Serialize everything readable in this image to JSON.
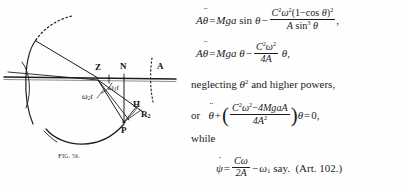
{
  "figure": {
    "caption_prefix": "F",
    "caption": "Fig. 56.",
    "caption_small": "IG. 56.",
    "labels": {
      "z": "Z",
      "n": "N",
      "a": "A",
      "h": "H",
      "p": "P",
      "r2_base": "R",
      "r2_sub": "2",
      "omega1t": "ω",
      "omega1t_sub": "1",
      "omega1t_tail": "t",
      "omega2t": "ω",
      "omega2t_sub": "2",
      "omega2t_tail": "t"
    },
    "colors": {
      "ink": "#1c1c1c",
      "paper": "#fefefe"
    }
  },
  "math": {
    "eq1": {
      "lhs_A": "A",
      "lhs_theta": "θ",
      "equals": "=",
      "rhs_Mga": "Mga",
      "rhs_sin": "sin",
      "rhs_theta": "θ",
      "minus": "−",
      "num_C": "C",
      "num_C_sup": "2",
      "num_omega": "ω",
      "num_omega_sup": "2",
      "num_paren_open": "(1",
      "num_minus": "−",
      "num_cos": "cos",
      "num_theta": "θ",
      "num_paren_close": ")",
      "num_close_sup": "2",
      "den_A": "A",
      "den_sin": "sin",
      "den_sin_sup": "3",
      "den_theta": "θ",
      "trailing": ","
    },
    "eq2": {
      "lhs_A": "A",
      "lhs_theta": "θ",
      "equals": "=",
      "rhs_Mga": "Mga",
      "rhs_theta": "θ",
      "minus": "−",
      "num_C": "C",
      "num_C_sup": "2",
      "num_omega": "ω",
      "num_omega_sup": "2",
      "den": "4A",
      "tail_theta": "θ",
      "trailing": ","
    },
    "neglect_line": {
      "text_before": "neglecting",
      "theta": "θ",
      "theta_sup": "2",
      "text_after": "and higher powers,"
    },
    "eq3": {
      "or_word": "or",
      "theta": "θ",
      "plus": "+",
      "paren_open": "(",
      "num_C": "C",
      "num_C_sup": "2",
      "num_omega": "ω",
      "num_omega_sup": "2",
      "num_minus": "−",
      "num_rest": "4MgaA",
      "den_4A": "4A",
      "den_sup": "2",
      "paren_close": ")",
      "tail_theta": "θ",
      "equals": "=",
      "zero": "0,"
    },
    "while_word": "while",
    "eq4": {
      "psi": "ψ",
      "equals": "=",
      "num_C": "C",
      "num_omega": "ω",
      "den": "2A",
      "minus": "−",
      "omega": "ω",
      "omega_sub": "1",
      "say": "say.",
      "reference": "(Art. 102.)"
    }
  }
}
